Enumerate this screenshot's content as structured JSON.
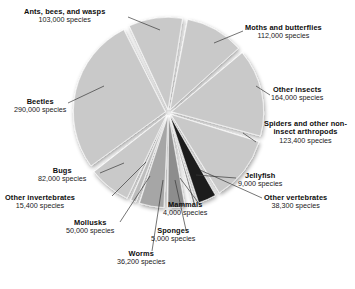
{
  "chart_data": {
    "type": "pie",
    "title": "",
    "units": "species",
    "total_species": 1222300,
    "legend_position": "callout-labels",
    "categories": [
      "Moths and butterflies",
      "Other insects",
      "Spiders and other non-insect arthropods",
      "Other vertebrates",
      "Jellyfish",
      "Mammals",
      "Sponges",
      "Worms",
      "Mollusks",
      "Other invertebrates",
      "Bugs",
      "Beetles",
      "Ants, bees, and wasps"
    ],
    "values": [
      112000,
      164000,
      123400,
      38300,
      9000,
      4000,
      5000,
      36200,
      50000,
      15400,
      82000,
      290000,
      103000
    ],
    "value_labels": [
      "112,000 species",
      "164,000 species",
      "123,400 species",
      "38,300 species",
      "9,000 species",
      "4,000 species",
      "5,000 species",
      "36,200 species",
      "50,000 species",
      "15,400 species",
      "82,000 species",
      "290,000 species",
      "103,000 species"
    ],
    "slice_colors": [
      "#c9c9c9",
      "#c9c9c9",
      "#c9c9c9",
      "#1c1c1c",
      "#5e5e5e",
      "#2b2b2b",
      "#9a9a9a",
      "#8d8d8d",
      "#a6a6a6",
      "#bdbdbd",
      "#c9c9c9",
      "#c9c9c9",
      "#c9c9c9"
    ]
  },
  "labels": {
    "ants": {
      "cat": "Ants, bees, and wasps",
      "val": "103,000 species"
    },
    "moths": {
      "cat": "Moths and butterflies",
      "val": "112,000 species"
    },
    "other_insects": {
      "cat": "Other insects",
      "val": "164,000 species"
    },
    "spiders": {
      "cat": "Spiders and other non-insect arthropods",
      "cat_line1": "Spiders and other non-",
      "cat_line2": "insect arthropods",
      "val": "123,400 species"
    },
    "beetles": {
      "cat": "Beetles",
      "val": "290,000 species"
    },
    "bugs": {
      "cat": "Bugs",
      "val": "82,000 species"
    },
    "other_invertebrates": {
      "cat": "Other invertebrates",
      "val": "15,400 species"
    },
    "mollusks": {
      "cat": "Mollusks",
      "val": "50,000 species"
    },
    "worms": {
      "cat": "Worms",
      "val": "36,200 species"
    },
    "sponges": {
      "cat": "Sponges",
      "val": "5,000 species"
    },
    "mammals": {
      "cat": "Mammals",
      "val": "4,000 species"
    },
    "jellyfish": {
      "cat": "Jellyfish",
      "val": "9,000 species"
    },
    "other_vertebrates": {
      "cat": "Other vertebrates",
      "val": "38,300 species"
    }
  },
  "colors": {
    "slice_light": "#c9c9c9",
    "slice_dark": "#1c1c1c",
    "background": "#ffffff",
    "text": "#111111",
    "leader_line": "#3a3a3a"
  }
}
